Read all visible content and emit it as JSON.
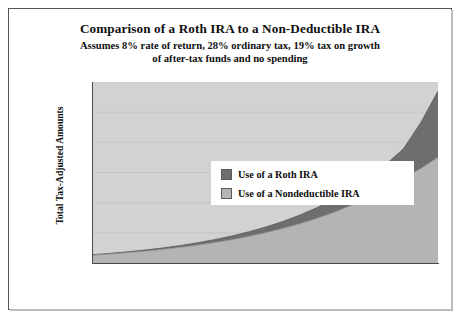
{
  "chart_data": {
    "type": "area",
    "title": "Comparison of a Roth IRA to a Non-Deductible IRA",
    "subtitle_line1": "Assumes 8% rate of return, 28% ordinary tax, 19% tax on growth",
    "subtitle_line2": "of after-tax funds and no spending",
    "xlabel": "AGE",
    "ylabel": "Total Tax-Adjusted Amounts",
    "xlim": [
      60,
      100
    ],
    "ylim": [
      0,
      1200000
    ],
    "xticks": [
      60,
      65,
      70,
      75,
      80,
      85,
      90,
      95,
      100
    ],
    "xtick_labels": [
      "60",
      "65",
      "70",
      "75",
      "80",
      "85",
      "90",
      "95",
      "100"
    ],
    "yticks": [
      0,
      200000,
      400000,
      600000,
      800000,
      1000000,
      1200000
    ],
    "ytick_labels": [
      "$0",
      "$200,000",
      "$400,000",
      "$600,000",
      "$800,000",
      "$1,000,000",
      "$1,200,000"
    ],
    "grid": true,
    "stacked": true,
    "legend_position": "upper-left-inside",
    "plot_background": "#d2d2d2",
    "x": [
      60,
      62,
      64,
      66,
      68,
      70,
      72,
      74,
      76,
      78,
      80,
      82,
      84,
      86,
      88,
      90,
      92,
      94,
      96,
      98,
      100
    ],
    "series": [
      {
        "name": "Use of a Nondeductible IRA",
        "color": "#b4b4b4",
        "values": [
          52000,
          59000,
          68000,
          78000,
          89000,
          102000,
          117000,
          134000,
          153000,
          175000,
          200000,
          228000,
          260000,
          296000,
          337000,
          383000,
          435000,
          494000,
          560000,
          626000,
          700000
        ]
      },
      {
        "name": "Use of a Roth IRA",
        "color": "#6e6e6e",
        "values": [
          55000,
          64000,
          74000,
          86000,
          99000,
          115000,
          133000,
          154000,
          178000,
          206000,
          238000,
          275000,
          318000,
          368000,
          425000,
          491000,
          568000,
          656000,
          758000,
          930000,
          1140000
        ]
      }
    ]
  },
  "legend": {
    "items": [
      {
        "label": "Use of a Roth IRA",
        "color": "#6e6e6e"
      },
      {
        "label": "Use of a Nondeductible IRA",
        "color": "#b4b4b4"
      }
    ]
  }
}
